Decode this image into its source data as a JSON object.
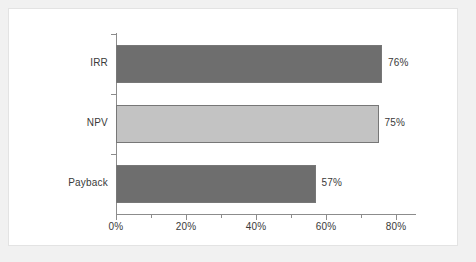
{
  "page": {
    "background_color": "#f1f1f1",
    "panel_color": "#ffffff"
  },
  "chart_data": {
    "type": "bar",
    "orientation": "horizontal",
    "title": "",
    "subtitle": "",
    "xlabel": "",
    "ylabel": "",
    "categories": [
      "IRR",
      "NPV",
      "Payback"
    ],
    "values": [
      76,
      75,
      57
    ],
    "value_labels": [
      "76%",
      "75%",
      "57%"
    ],
    "xlim": [
      0,
      80
    ],
    "xtick_values": [
      0,
      20,
      40,
      60,
      80
    ],
    "xtick_labels": [
      "0%",
      "20%",
      "40%",
      "60%",
      "80%"
    ],
    "xtick_minor_values": [
      10,
      30,
      50,
      70
    ],
    "grid": false,
    "legend": "none",
    "bar_colors": [
      "#6e6e6e",
      "#c3c3c3",
      "#6e6e6e"
    ],
    "bar_border_color": "#777777",
    "axis_color": "#8c8c8c",
    "text_color": "#3a3a3a"
  }
}
